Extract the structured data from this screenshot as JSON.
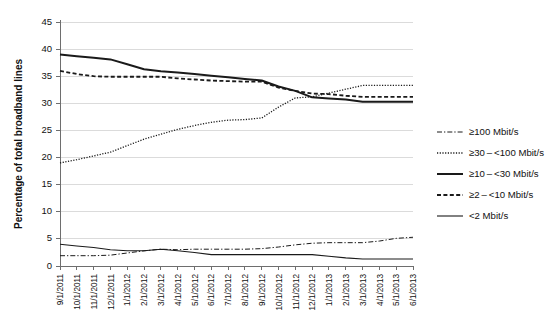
{
  "chart_data": {
    "type": "line",
    "title": "",
    "subtitle": "",
    "xlabel": "",
    "ylabel": "Percentage of total broadband lines",
    "ylim": [
      0,
      45
    ],
    "y_ticks": [
      0,
      5,
      10,
      15,
      20,
      25,
      30,
      35,
      40,
      45
    ],
    "grid": "horizontal",
    "legend_position": "right",
    "categories": [
      "9/1/2011",
      "10/1/2011",
      "11/1/2011",
      "12/1/2011",
      "1/1/2012",
      "2/1/2012",
      "3/1/2012",
      "4/1/2012",
      "5/1/2012",
      "6/1/2012",
      "7/1/2012",
      "8/1/2012",
      "9/1/2012",
      "10/1/2012",
      "11/1/2012",
      "12/1/2012",
      "1/1/2013",
      "2/1/2013",
      "3/1/2013",
      "4/1/2013",
      "5/1/2013",
      "6/1/2013"
    ],
    "series": [
      {
        "name": "≥100 Mbit/s",
        "style": "dash-dot",
        "values": [
          1.9,
          1.9,
          1.9,
          2.0,
          2.4,
          2.8,
          3.1,
          3.0,
          3.1,
          3.1,
          3.1,
          3.1,
          3.2,
          3.5,
          3.9,
          4.2,
          4.3,
          4.3,
          4.3,
          4.6,
          5.1,
          5.3
        ]
      },
      {
        "name": "≥30 – <100 Mbit/s",
        "style": "dotted",
        "values": [
          19.0,
          19.6,
          20.3,
          21.0,
          22.2,
          23.4,
          24.3,
          25.2,
          25.9,
          26.5,
          26.9,
          27.0,
          27.3,
          29.3,
          31.0,
          31.2,
          31.9,
          32.6,
          33.3,
          33.3,
          33.3,
          33.3
        ]
      },
      {
        "name": "≥10 – <30 Mbit/s",
        "style": "solid-thick",
        "values": [
          39.0,
          38.7,
          38.4,
          38.1,
          37.2,
          36.3,
          35.9,
          35.7,
          35.4,
          35.1,
          34.8,
          34.5,
          34.2,
          33.1,
          32.3,
          31.1,
          30.9,
          30.7,
          30.3,
          30.3,
          30.3,
          30.3
        ]
      },
      {
        "name": "≥2 – <10 Mbit/s",
        "style": "dashed",
        "values": [
          36.0,
          35.4,
          35.0,
          34.9,
          34.9,
          34.9,
          34.9,
          34.6,
          34.4,
          34.2,
          34.1,
          34.0,
          34.0,
          32.9,
          32.3,
          31.8,
          31.7,
          31.4,
          31.2,
          31.2,
          31.2,
          31.2
        ]
      },
      {
        "name": "<2 Mbit/s",
        "style": "solid-thin",
        "values": [
          4.0,
          3.7,
          3.4,
          3.0,
          2.8,
          2.8,
          3.1,
          2.8,
          2.5,
          2.1,
          2.1,
          2.1,
          2.1,
          2.1,
          2.1,
          2.1,
          1.8,
          1.5,
          1.3,
          1.3,
          1.3,
          1.3
        ]
      }
    ]
  },
  "axes": {
    "y_axis_title": "Percentage of total broadband lines"
  }
}
